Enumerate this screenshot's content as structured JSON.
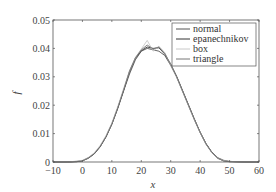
{
  "chart_data": {
    "type": "line",
    "title": "",
    "xlabel": "x",
    "ylabel": "f",
    "xlim": [
      -10,
      60
    ],
    "ylim": [
      0,
      0.05
    ],
    "xticks": [
      -10,
      0,
      10,
      20,
      30,
      40,
      50,
      60
    ],
    "yticks": [
      0,
      0.01,
      0.02,
      0.03,
      0.04,
      0.05
    ],
    "xtick_labels": [
      "-10",
      "0",
      "10",
      "20",
      "30",
      "40",
      "50",
      "60"
    ],
    "ytick_labels": [
      "0",
      "0.01",
      "0.02",
      "0.03",
      "0.04",
      "0.05"
    ],
    "grid": false,
    "legend_position": "upper right",
    "x": [
      -10,
      -5,
      -2,
      0,
      2,
      4,
      6,
      8,
      10,
      12,
      14,
      16,
      18,
      20,
      22,
      24,
      26,
      28,
      30,
      32,
      34,
      36,
      38,
      40,
      42,
      44,
      46,
      48,
      50,
      55,
      60
    ],
    "series": [
      {
        "name": "normal",
        "color": "#555555",
        "values": [
          0,
          0,
          0.0002,
          0.0005,
          0.0015,
          0.003,
          0.0055,
          0.009,
          0.0135,
          0.019,
          0.025,
          0.031,
          0.036,
          0.039,
          0.04,
          0.0395,
          0.039,
          0.0375,
          0.034,
          0.03,
          0.025,
          0.02,
          0.015,
          0.0105,
          0.0065,
          0.0035,
          0.0015,
          0.0006,
          0.0002,
          0,
          0
        ]
      },
      {
        "name": "epanechnikov",
        "color": "#333333",
        "values": [
          0,
          0,
          0.0001,
          0.0004,
          0.0013,
          0.0028,
          0.0053,
          0.0088,
          0.0133,
          0.0188,
          0.0252,
          0.0318,
          0.0365,
          0.0392,
          0.0405,
          0.04,
          0.0402,
          0.038,
          0.0345,
          0.0302,
          0.0252,
          0.0202,
          0.0152,
          0.0105,
          0.0064,
          0.0033,
          0.0013,
          0.0004,
          0.0001,
          0,
          0
        ]
      },
      {
        "name": "box",
        "color": "#c8c8c8",
        "values": [
          0,
          0,
          0.0003,
          0.0006,
          0.0016,
          0.0032,
          0.0058,
          0.0093,
          0.0138,
          0.0195,
          0.0258,
          0.0322,
          0.0368,
          0.0398,
          0.0428,
          0.039,
          0.0408,
          0.0385,
          0.0342,
          0.0298,
          0.0248,
          0.0198,
          0.0148,
          0.0103,
          0.0062,
          0.0032,
          0.0013,
          0.0005,
          0.0002,
          0,
          0
        ]
      },
      {
        "name": "triangle",
        "color": "#777777",
        "values": [
          0,
          0,
          0.0001,
          0.0004,
          0.0014,
          0.0029,
          0.0054,
          0.0089,
          0.0134,
          0.019,
          0.0254,
          0.032,
          0.0367,
          0.0395,
          0.0412,
          0.0398,
          0.0405,
          0.0382,
          0.0343,
          0.03,
          0.025,
          0.02,
          0.015,
          0.0104,
          0.0063,
          0.0033,
          0.0013,
          0.0004,
          0.0001,
          0,
          0
        ]
      }
    ]
  }
}
